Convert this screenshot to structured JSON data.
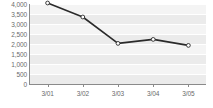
{
  "chart_data": {
    "type": "line",
    "title": "",
    "subtitle": "",
    "xlabel": "",
    "ylabel": "",
    "categories": [
      "3/01",
      "3/02",
      "3/03",
      "3/04",
      "3/05"
    ],
    "values": [
      4050,
      3350,
      2030,
      2230,
      1930
    ],
    "series": [
      {
        "name": "",
        "values": [
          4050,
          3350,
          2030,
          2230,
          1930
        ]
      }
    ],
    "ylim": [
      0,
      4000
    ],
    "y_ticks": [
      0,
      500,
      1000,
      1500,
      2000,
      2500,
      3000,
      3500,
      4000
    ],
    "y_tick_labels": [
      "0",
      "500",
      "1,000",
      "1,500",
      "2,000",
      "2,500",
      "3,000",
      "3,500",
      "4,000"
    ],
    "x_tick_labels": [
      "3/01",
      "3/02",
      "3/03",
      "3/04",
      "3/05"
    ],
    "grid": true,
    "grid_orientation": "horizontal",
    "legend": false,
    "legend_position": "none",
    "marker": "open-circle",
    "annotations": []
  },
  "style": {
    "line_color": "#2b2b2b",
    "marker_fill": "#ffffff",
    "marker_stroke": "#2b2b2b",
    "plot_background": "#ebebeb",
    "band_color": "#f4f4f4",
    "gridline_color": "#ffffff",
    "axis_color": "#8a8a8a",
    "tick_label_color": "#6a6a6a",
    "page_background": "#ffffff"
  }
}
